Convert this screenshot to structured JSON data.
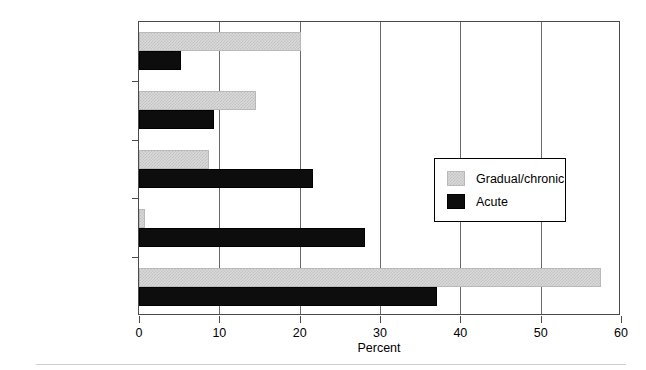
{
  "chart_data": {
    "type": "bar",
    "orientation": "horizontal",
    "title": "",
    "xlabel": "Percent",
    "ylabel": "",
    "xlim": [
      0,
      60
    ],
    "xticks": [
      0,
      10,
      20,
      30,
      40,
      50,
      60
    ],
    "xtick_labels": [
      "0",
      "10",
      "20",
      "30",
      "40",
      "50",
      "60"
    ],
    "grid": true,
    "grid_axis": "x",
    "legend_position": "center-right",
    "categories": [
      "Preexisting condition",
      "Overuse/intensity",
      "Twist/stretch",
      "Direct blow",
      "Customary activity"
    ],
    "series": [
      {
        "name": "Gradual/chronic",
        "color": "#d9d9d9",
        "values": [
          20.2,
          14.6,
          8.7,
          0.8,
          57.5
        ]
      },
      {
        "name": "Acute",
        "color": "#0d0d0d",
        "values": [
          5.2,
          9.3,
          21.7,
          28.1,
          37.1
        ]
      }
    ]
  },
  "legend": {
    "items": [
      {
        "label": "Gradual/chronic",
        "swatch": "gradual"
      },
      {
        "label": "Acute",
        "swatch": "acute"
      }
    ]
  }
}
